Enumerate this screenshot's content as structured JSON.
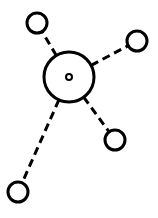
{
  "diagram": {
    "type": "hub-and-spoke",
    "colors": {
      "stroke": "#000000",
      "background": "#ffffff"
    },
    "hub": {
      "id": "hub",
      "cx": 69,
      "cy": 77,
      "r": 25,
      "center_dot_r": 3
    },
    "nodes": [
      {
        "id": "node-top-left",
        "cx": 37,
        "cy": 23,
        "r": 10
      },
      {
        "id": "node-top-right",
        "cx": 137,
        "cy": 41,
        "r": 10
      },
      {
        "id": "node-bottom-right",
        "cx": 115,
        "cy": 140,
        "r": 10
      },
      {
        "id": "node-bottom-left",
        "cx": 18,
        "cy": 192,
        "r": 10
      }
    ],
    "edges": [
      {
        "from": "hub",
        "to": "node-top-left",
        "style": "dashed"
      },
      {
        "from": "hub",
        "to": "node-top-right",
        "style": "dashed"
      },
      {
        "from": "hub",
        "to": "node-bottom-right",
        "style": "dashed"
      },
      {
        "from": "hub",
        "to": "node-bottom-left",
        "style": "dashed"
      }
    ]
  }
}
